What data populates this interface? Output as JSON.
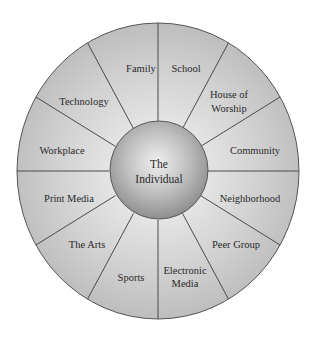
{
  "diagram": {
    "type": "influence-wheel",
    "center": {
      "label_line1": "The",
      "label_line2": "Individual"
    },
    "segments": [
      {
        "id": "family",
        "lines": [
          "Family"
        ]
      },
      {
        "id": "school",
        "lines": [
          "School"
        ]
      },
      {
        "id": "house-of-worship",
        "lines": [
          "House of",
          "Worship"
        ]
      },
      {
        "id": "community",
        "lines": [
          "Community"
        ]
      },
      {
        "id": "neighborhood",
        "lines": [
          "Neighborhood"
        ]
      },
      {
        "id": "peer-group",
        "lines": [
          "Peer Group"
        ]
      },
      {
        "id": "electronic-media",
        "lines": [
          "Electronic",
          "Media"
        ]
      },
      {
        "id": "sports",
        "lines": [
          "Sports"
        ]
      },
      {
        "id": "the-arts",
        "lines": [
          "The Arts"
        ]
      },
      {
        "id": "print-media",
        "lines": [
          "Print Media"
        ]
      },
      {
        "id": "workplace",
        "lines": [
          "Workplace"
        ]
      },
      {
        "id": "technology",
        "lines": [
          "Technology"
        ]
      }
    ],
    "colors": {
      "ring_fill": "#c9c9c9",
      "ring_inner_highlight": "#e2e2e2",
      "spoke": "#4a4a4a",
      "sphere_light": "#eeeeee",
      "sphere_dark": "#8c8c8c",
      "text": "#2a2a2a"
    }
  }
}
